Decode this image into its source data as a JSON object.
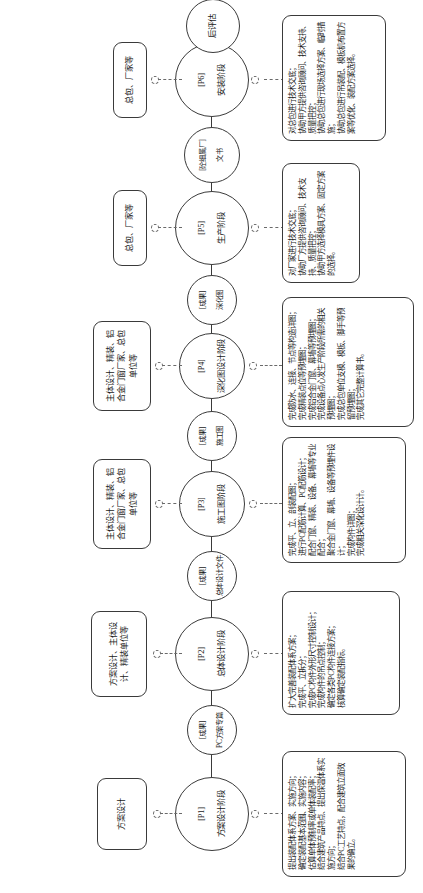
{
  "diagram": {
    "type": "process-flow",
    "orientation": "vertical-rotated",
    "title_present": false,
    "phases": [
      {
        "id": "P1",
        "code": "[P1]",
        "name": "方案设计阶段",
        "deliverable": {
          "tag": "[成果]",
          "name": "PC方案专篇"
        },
        "participants": "方案设计",
        "tasks": [
          "提出装配体系方案、实施方向；",
          "确定装配基本范围、实施内容；",
          "估算单体预制率或单体装配率；",
          "结合建筑产品特点、提出保温体系实施方向；",
          "结合PC工艺特点，配合建筑立面效果的确立。"
        ]
      },
      {
        "id": "P2",
        "code": "[P2]",
        "name": "总体设计阶段",
        "deliverable": {
          "tag": "[成果]",
          "name": "总体设计文件"
        },
        "participants": "方案设计、主体设计、精装单位等",
        "tasks": [
          "扩大完善装配体系方案；",
          "完成平、立拆分；",
          "完成PC构件外形尺寸控制设计；",
          "完成构件的吊点控制；",
          "确定各类PC构件连接方案；",
          "核算确定装配指标。"
        ]
      },
      {
        "id": "P3",
        "code": "[P3]",
        "name": "施工图阶段",
        "deliverable": {
          "tag": "[成果]",
          "name": "施工图"
        },
        "participants": "主体设计、精装、铝合金门窗厂家、总包单位等",
        "tasks": [
          "完成平、立、剖装配图；",
          "进行PC配筋计算、PC配筋设计；",
          "配合门窗、精装、设备、幕墙等专业配合；",
          "聚合金门窗、幕墙、设备等预埋件设计；",
          "完成构件详图；",
          "完成相关深化设计计。"
        ]
      },
      {
        "id": "P4",
        "code": "[P4]",
        "name": "深化图设计阶段",
        "deliverable": {
          "tag": "[成果]",
          "name": "深化图"
        },
        "participants": "主体设计、精装、铝合金门窗厂家、总包单位等",
        "tasks": [
          "完成防水、连接、节点等构造详图；",
          "完成精装点位等预埋图；",
          "完成铝合金门窗、幕墙等预埋图；",
          "完成设备点心发生产阶段所需的相关预埋图；",
          "完成总包单位支模、模板、脚手等预留预埋图；",
          "完成其它完整计算书。"
        ]
      },
      {
        "id": "P5",
        "code": "[P5]",
        "name": "生产阶段",
        "deliverable": {
          "tag": "[砼细属厂]",
          "name": "文书"
        },
        "participants": "总包、厂家等",
        "tasks": [
          "对厂家进行技术交底；",
          "协助厂方提供咨询顾问、技术支持、质量把控；",
          "协助甲方选择模具方案、固定方案的选择。"
        ]
      },
      {
        "id": "P6",
        "code": "[P6]",
        "name": "安装阶段",
        "deliverable": {
          "tag": "",
          "name": "后评估"
        },
        "participants": "总包、厂家等",
        "tasks": [
          "对总包进行技术交底；",
          "协助甲方提供咨询顾问、技术支持、质量把控；",
          "协助总包进行现场选择方案、临时措施；",
          "协助总包进行吊装配、模板机布置方案等优化、装配方案选择。"
        ]
      }
    ]
  }
}
